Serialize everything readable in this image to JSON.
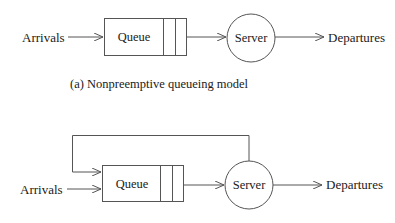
{
  "diagram_a": {
    "arrivals_label": "Arrivals",
    "queue_label": "Queue",
    "server_label": "Server",
    "departures_label": "Departures",
    "caption": "(a) Nonpreemptive queueing model"
  },
  "diagram_b": {
    "arrivals_label": "Arrivals",
    "queue_label": "Queue",
    "server_label": "Server",
    "departures_label": "Departures",
    "has_feedback_loop": true
  },
  "colors": {
    "stroke": "#555555",
    "text": "#1a1a1a",
    "background": "#ffffff"
  }
}
